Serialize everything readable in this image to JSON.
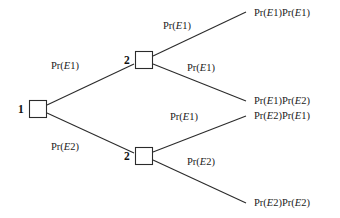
{
  "diagram": {
    "type": "probability-tree",
    "nodes": [
      {
        "id": "root",
        "number": "1",
        "x": 37,
        "y": 109
      },
      {
        "id": "upper",
        "number": "2",
        "x": 143,
        "y": 60
      },
      {
        "id": "lower",
        "number": "2",
        "x": 143,
        "y": 156
      }
    ],
    "edges": [
      {
        "id": "root-upper",
        "label": "Pr(E1)",
        "prefix": "Pr(",
        "variable": "E",
        "index": "1",
        "suffix": ")"
      },
      {
        "id": "root-lower",
        "label": "Pr(E2)",
        "prefix": "Pr(",
        "variable": "E",
        "index": "2",
        "suffix": ")"
      },
      {
        "id": "upper-top",
        "label": "Pr(E1)",
        "prefix": "Pr(",
        "variable": "E",
        "index": "1",
        "suffix": ")"
      },
      {
        "id": "upper-bottom",
        "label": "Pr(E1)",
        "prefix": "Pr(",
        "variable": "E",
        "index": "1",
        "suffix": ")"
      },
      {
        "id": "lower-top",
        "label": "Pr(E1)",
        "prefix": "Pr(",
        "variable": "E",
        "index": "1",
        "suffix": ")"
      },
      {
        "id": "lower-bottom",
        "label": "Pr(E2)",
        "prefix": "Pr(",
        "variable": "E",
        "index": "2",
        "suffix": ")"
      }
    ],
    "leaves": [
      {
        "id": "leaf-1",
        "label": "Pr(E1)Pr(E1)",
        "first_index": "1",
        "second_index": "1"
      },
      {
        "id": "leaf-2",
        "label": "Pr(E1)Pr(E2)",
        "first_index": "1",
        "second_index": "2"
      },
      {
        "id": "leaf-3",
        "label": "Pr(E2)Pr(E1)",
        "first_index": "2",
        "second_index": "1"
      },
      {
        "id": "leaf-4",
        "label": "Pr(E2)Pr(E2)",
        "first_index": "2",
        "second_index": "2"
      }
    ],
    "colors": {
      "line": "#2b2b2b",
      "text": "#1a1a1a",
      "background": "#ffffff"
    }
  }
}
